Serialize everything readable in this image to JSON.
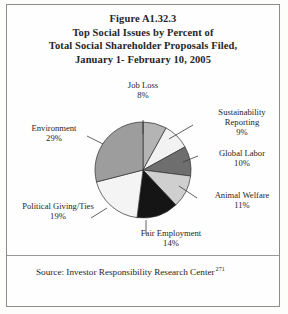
{
  "figure": {
    "title_lines": [
      "Figure A1.32.3",
      "Top Social Issues by Percent of",
      "Total Social Shareholder Proposals Filed,",
      "January 1- February 10, 2005"
    ],
    "source_text": "Source: Investor Responsibility Research Center",
    "source_footnote_marker": "271"
  },
  "chart_data": {
    "type": "pie",
    "title": "Figure A1.32.3 Top Social Issues by Percent of Total Social Shareholder Proposals Filed, January 1- February 10, 2005",
    "xlabel": "",
    "ylabel": "",
    "legend_position": "none",
    "grid": false,
    "value_unit": "percent",
    "start_angle_deg": 0,
    "direction": "clockwise",
    "categories": [
      "Job Loss",
      "Sustainability Reporting",
      "Global Labor",
      "Animal Welfare",
      "Fair Employment",
      "Political Giving/Ties",
      "Environment"
    ],
    "values": [
      8,
      9,
      10,
      11,
      14,
      19,
      29
    ],
    "labels": [
      {
        "name": "Job Loss",
        "value": 8,
        "value_text": "8%",
        "color": "#b4b4b4"
      },
      {
        "name": "Sustainability Reporting",
        "value": 9,
        "value_text": "9%",
        "color": "#f2f2f2"
      },
      {
        "name": "Global Labor",
        "value": 10,
        "value_text": "10%",
        "color": "#6e6e6e"
      },
      {
        "name": "Animal Welfare",
        "value": 11,
        "value_text": "11%",
        "color": "#cfcfcf"
      },
      {
        "name": "Fair Employment",
        "value": 14,
        "value_text": "14%",
        "color": "#151515"
      },
      {
        "name": "Political Giving/Ties",
        "value": 19,
        "value_text": "19%",
        "color": "#f4f4f4"
      },
      {
        "name": "Environment",
        "value": 29,
        "value_text": "29%",
        "color": "#9d9d9d"
      }
    ]
  },
  "slices": {
    "job_loss": {
      "label": "Job Loss",
      "pct": "8%"
    },
    "sustain": {
      "label_line1": "Sustainability",
      "label_line2": "Reporting",
      "pct": "9%"
    },
    "global_labor": {
      "label": "Global Labor",
      "pct": "10%"
    },
    "animal": {
      "label": "Animal Welfare",
      "pct": "11%"
    },
    "fair_emp": {
      "label": "Fair Employment",
      "pct": "14%"
    },
    "political": {
      "label": "Political Giving/Ties",
      "pct": "19%"
    },
    "environment": {
      "label": "Environment",
      "pct": "29%"
    }
  }
}
